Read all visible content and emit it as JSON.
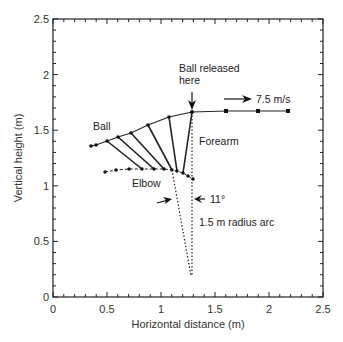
{
  "chart_data": {
    "type": "line",
    "title": "",
    "xlabel": "Horizontal distance (m)",
    "ylabel": "Vertical height (m)",
    "xlim": [
      0,
      2.5
    ],
    "ylim": [
      0,
      2.5
    ],
    "grid": false,
    "x_ticks": [
      "0",
      "0.5",
      "1",
      "1.5",
      "2",
      "2.5"
    ],
    "y_ticks": [
      "0",
      "0.5",
      "1",
      "1.5",
      "2",
      "2.5"
    ],
    "series": [
      {
        "name": "Ball",
        "points": [
          [
            0.35,
            1.36
          ],
          [
            0.4,
            1.37
          ],
          [
            0.5,
            1.4
          ],
          [
            0.6,
            1.44
          ],
          [
            0.72,
            1.48
          ],
          [
            0.88,
            1.55
          ],
          [
            1.07,
            1.62
          ],
          [
            1.29,
            1.66
          ],
          [
            1.6,
            1.67
          ],
          [
            1.9,
            1.67
          ],
          [
            2.18,
            1.67
          ]
        ]
      },
      {
        "name": "Elbow",
        "points": [
          [
            0.48,
            1.13
          ],
          [
            0.58,
            1.15
          ],
          [
            0.7,
            1.16
          ],
          [
            0.82,
            1.16
          ],
          [
            0.93,
            1.16
          ],
          [
            1.03,
            1.16
          ],
          [
            1.1,
            1.15
          ],
          [
            1.15,
            1.14
          ],
          [
            1.2,
            1.12
          ],
          [
            1.25,
            1.09
          ],
          [
            1.3,
            1.06
          ]
        ]
      },
      {
        "name": "Forearm segments",
        "segments": [
          [
            [
              0.5,
              1.4
            ],
            [
              0.82,
              1.16
            ]
          ],
          [
            [
              0.6,
              1.44
            ],
            [
              0.93,
              1.16
            ]
          ],
          [
            [
              0.72,
              1.48
            ],
            [
              1.03,
              1.16
            ]
          ],
          [
            [
              0.88,
              1.55
            ],
            [
              1.1,
              1.15
            ]
          ],
          [
            [
              1.07,
              1.62
            ],
            [
              1.15,
              1.14
            ]
          ],
          [
            [
              1.29,
              1.66
            ],
            [
              1.2,
              1.12
            ]
          ]
        ]
      },
      {
        "name": "1.5 m radius arc lines",
        "segments": [
          [
            [
              1.1,
              1.15
            ],
            [
              1.28,
              0.19
            ]
          ],
          [
            [
              1.29,
              1.66
            ],
            [
              1.29,
              0.19
            ]
          ]
        ],
        "style": "dotted"
      }
    ],
    "annotations": [
      {
        "text": "Ball released here",
        "x": 1.29,
        "y": 1.66
      },
      {
        "text": "7.5 m/s",
        "x": 1.85,
        "y": 1.72
      },
      {
        "text": "Ball",
        "x": 0.5,
        "y": 1.55
      },
      {
        "text": "Forearm",
        "x": 1.42,
        "y": 1.4
      },
      {
        "text": "Elbow",
        "x": 0.85,
        "y": 1.07
      },
      {
        "text": "11°",
        "x": 1.45,
        "y": 0.88
      },
      {
        "text": "1.5 m radius arc",
        "x": 1.42,
        "y": 0.7
      }
    ]
  },
  "labels": {
    "xlabel": "Horizontal distance (m)",
    "ylabel": "Vertical height (m)",
    "x_ticks": [
      "0",
      "0.5",
      "1",
      "1.5",
      "2",
      "2.5"
    ],
    "y_ticks": [
      "0",
      "0.5",
      "1",
      "1.5",
      "2",
      "2.5"
    ],
    "released_line1": "Ball released",
    "released_line2": "here",
    "speed": "7.5 m/s",
    "ball": "Ball",
    "forearm": "Forearm",
    "elbow": "Elbow",
    "angle": "11°",
    "arc": "1.5 m radius arc"
  }
}
